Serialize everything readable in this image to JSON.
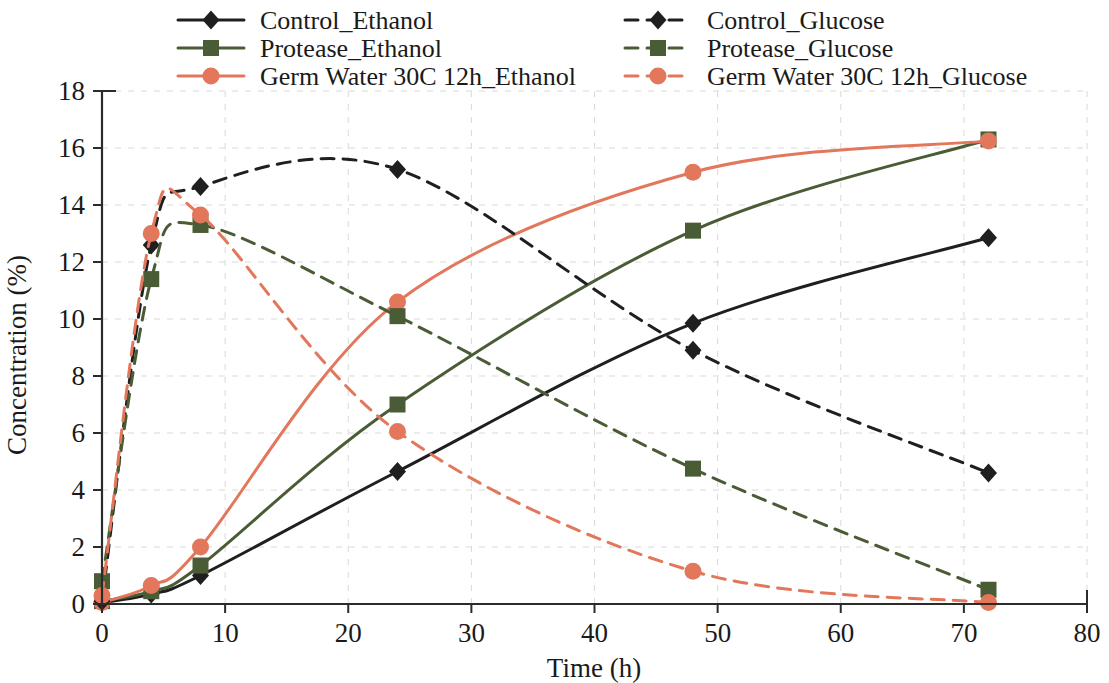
{
  "chart_data": {
    "type": "line",
    "title": "",
    "xlabel": "Time (h)",
    "ylabel": "Concentration (%)",
    "xlim": [
      0,
      80
    ],
    "ylim": [
      0,
      18
    ],
    "xticks": [
      0,
      10,
      20,
      30,
      40,
      50,
      60,
      70,
      80
    ],
    "yticks": [
      0,
      2,
      4,
      6,
      8,
      10,
      12,
      14,
      16,
      18
    ],
    "x": [
      0,
      4,
      8,
      24,
      48,
      72
    ],
    "grid": true,
    "legend_position": "top",
    "series": [
      {
        "name": "Control_Ethanol",
        "color": "#1f1f1f",
        "marker": "diamond",
        "dash": false,
        "values": [
          0.05,
          0.35,
          1.0,
          4.65,
          9.85,
          12.85
        ]
      },
      {
        "name": "Protease_Ethanol",
        "color": "#4a5c35",
        "marker": "square",
        "dash": false,
        "values": [
          0.1,
          0.45,
          1.35,
          7.0,
          13.1,
          16.3
        ]
      },
      {
        "name": "Germ Water 30C 12h_Ethanol",
        "color": "#e2775c",
        "marker": "circle",
        "dash": false,
        "values": [
          0.05,
          0.65,
          2.0,
          10.6,
          15.15,
          16.25
        ]
      },
      {
        "name": "Control_Glucose",
        "color": "#1f1f1f",
        "marker": "diamond",
        "dash": true,
        "values": [
          0.1,
          12.6,
          14.65,
          15.25,
          8.9,
          4.6
        ]
      },
      {
        "name": "Protease_Glucose",
        "color": "#4a5c35",
        "marker": "square",
        "dash": true,
        "values": [
          0.8,
          11.4,
          13.3,
          10.1,
          4.75,
          0.5
        ]
      },
      {
        "name": "Germ Water 30C 12h_Glucose",
        "color": "#e2775c",
        "marker": "circle",
        "dash": true,
        "values": [
          0.3,
          13.0,
          13.65,
          6.05,
          1.15,
          0.05
        ]
      }
    ]
  },
  "legend": {
    "entries": [
      {
        "label": "Control_Ethanol",
        "col": 0,
        "row": 0
      },
      {
        "label": "Protease_Ethanol",
        "col": 0,
        "row": 1
      },
      {
        "label": "Germ Water 30C 12h_Ethanol",
        "col": 0,
        "row": 2
      },
      {
        "label": "Control_Glucose",
        "col": 1,
        "row": 0
      },
      {
        "label": "Protease_Glucose",
        "col": 1,
        "row": 1
      },
      {
        "label": "Germ Water 30C 12h_Glucose",
        "col": 1,
        "row": 2
      }
    ]
  },
  "colors": {
    "black": "#1f1f1f",
    "green": "#4a5c35",
    "salmon": "#e2775c",
    "grid": "#d9d9d9",
    "axis": "#2b2b2b",
    "background": "#ffffff"
  }
}
